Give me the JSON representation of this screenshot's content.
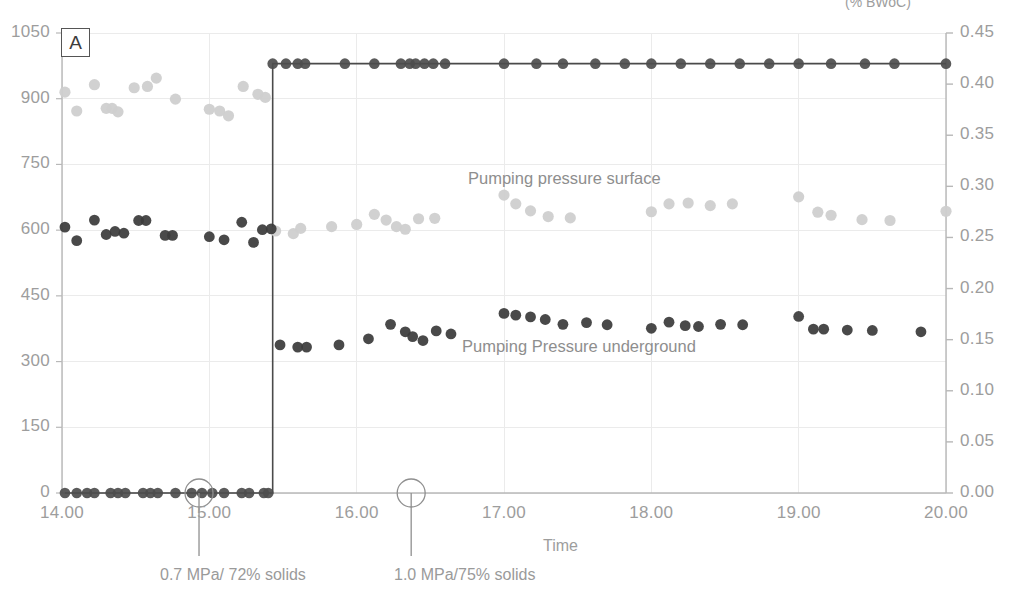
{
  "figure": {
    "panel_letter": "A",
    "background": "#ffffff"
  },
  "axes": {
    "x": {
      "label": "Time",
      "ticks": [
        "14.00",
        "15.00",
        "16.00",
        "17.00",
        "18.00",
        "19.00",
        "20.00"
      ],
      "min": 14.0,
      "max": 20.0
    },
    "y_left": {
      "ticks": [
        "0",
        "150",
        "300",
        "450",
        "600",
        "750",
        "900",
        "1050"
      ],
      "min": 0,
      "max": 1050,
      "label": ""
    },
    "y_right": {
      "ticks": [
        "0.00",
        "0.05",
        "0.10",
        "0.15",
        "0.20",
        "0.25",
        "0.30",
        "0.35",
        "0.40",
        "0.45"
      ],
      "min": 0.0,
      "max": 0.45,
      "label": "(% BWoC)"
    }
  },
  "series_labels": {
    "surface": "Pumping pressure surface",
    "underground": "Pumping Pressure underground"
  },
  "annotations": [
    {
      "text": "0.7 MPa/ 72% solids",
      "x": 14.93
    },
    {
      "text": "1.0 MPa/75% solids",
      "x": 16.37
    }
  ],
  "colors": {
    "surface_marker": "#cfcfcf",
    "underground_marker": "#3b3b3b",
    "step_line": "#4a4a4a",
    "grid": "#ebebeb",
    "axis": "#b8b8b8",
    "tick_text": "#9d9d9d"
  },
  "chart_data": {
    "type": "scatter",
    "title": "",
    "xlabel": "Time",
    "ylabel": "",
    "y2label": "(% BWoC)",
    "xlim": [
      14.0,
      20.0
    ],
    "ylim": [
      0,
      1050
    ],
    "y2lim": [
      0.0,
      0.45
    ],
    "grid": true,
    "legend": "inline-text-labels",
    "series": [
      {
        "name": "Pumping pressure surface",
        "axis": "left",
        "marker": "circle",
        "color": "#cfcfcf",
        "points": [
          [
            14.02,
            915
          ],
          [
            14.1,
            872
          ],
          [
            14.22,
            932
          ],
          [
            14.3,
            878
          ],
          [
            14.34,
            878
          ],
          [
            14.38,
            870
          ],
          [
            14.49,
            925
          ],
          [
            14.58,
            928
          ],
          [
            14.64,
            947
          ],
          [
            14.77,
            899
          ],
          [
            15.0,
            876
          ],
          [
            15.07,
            872
          ],
          [
            15.13,
            861
          ],
          [
            15.23,
            928
          ],
          [
            15.33,
            910
          ],
          [
            15.38,
            903
          ],
          [
            15.45,
            598
          ],
          [
            15.57,
            592
          ],
          [
            15.62,
            604
          ],
          [
            15.83,
            608
          ],
          [
            16.0,
            613
          ],
          [
            16.12,
            636
          ],
          [
            16.2,
            623
          ],
          [
            16.27,
            608
          ],
          [
            16.33,
            602
          ],
          [
            16.42,
            626
          ],
          [
            16.53,
            627
          ],
          [
            17.0,
            680
          ],
          [
            17.08,
            660
          ],
          [
            17.18,
            644
          ],
          [
            17.3,
            631
          ],
          [
            17.45,
            628
          ],
          [
            18.0,
            642
          ],
          [
            18.12,
            660
          ],
          [
            18.25,
            662
          ],
          [
            18.4,
            656
          ],
          [
            18.55,
            660
          ],
          [
            19.0,
            676
          ],
          [
            19.13,
            641
          ],
          [
            19.22,
            634
          ],
          [
            19.43,
            624
          ],
          [
            19.62,
            622
          ],
          [
            20.0,
            643
          ]
        ]
      },
      {
        "name": "Pumping Pressure underground",
        "axis": "left",
        "marker": "circle",
        "color": "#3b3b3b",
        "points": [
          [
            14.02,
            607
          ],
          [
            14.1,
            576
          ],
          [
            14.22,
            623
          ],
          [
            14.3,
            590
          ],
          [
            14.36,
            597
          ],
          [
            14.42,
            593
          ],
          [
            14.52,
            622
          ],
          [
            14.57,
            622
          ],
          [
            14.7,
            588
          ],
          [
            14.75,
            588
          ],
          [
            15.0,
            585
          ],
          [
            15.1,
            578
          ],
          [
            15.22,
            618
          ],
          [
            15.3,
            572
          ],
          [
            15.36,
            601
          ],
          [
            15.42,
            603
          ],
          [
            15.48,
            338
          ],
          [
            15.6,
            333
          ],
          [
            15.66,
            333
          ],
          [
            15.88,
            338
          ],
          [
            16.08,
            352
          ],
          [
            16.23,
            385
          ],
          [
            16.33,
            368
          ],
          [
            16.38,
            357
          ],
          [
            16.45,
            348
          ],
          [
            16.54,
            370
          ],
          [
            16.64,
            363
          ],
          [
            17.0,
            410
          ],
          [
            17.08,
            406
          ],
          [
            17.18,
            402
          ],
          [
            17.28,
            396
          ],
          [
            17.4,
            385
          ],
          [
            17.56,
            389
          ],
          [
            17.7,
            384
          ],
          [
            18.0,
            376
          ],
          [
            18.12,
            390
          ],
          [
            18.23,
            382
          ],
          [
            18.32,
            380
          ],
          [
            18.47,
            385
          ],
          [
            18.62,
            384
          ],
          [
            19.0,
            403
          ],
          [
            19.1,
            374
          ],
          [
            19.17,
            374
          ],
          [
            19.33,
            372
          ],
          [
            19.5,
            371
          ],
          [
            19.83,
            368
          ]
        ]
      },
      {
        "name": "Step trace (% BWoC)",
        "axis": "right",
        "marker": "circle-line",
        "color": "#3b3b3b",
        "points": [
          [
            14.02,
            0.0
          ],
          [
            14.1,
            0.0
          ],
          [
            14.17,
            0.0
          ],
          [
            14.22,
            0.0
          ],
          [
            14.33,
            0.0
          ],
          [
            14.38,
            0.0
          ],
          [
            14.43,
            0.0
          ],
          [
            14.55,
            0.0
          ],
          [
            14.6,
            0.0
          ],
          [
            14.65,
            0.0
          ],
          [
            14.77,
            0.0
          ],
          [
            14.88,
            0.0
          ],
          [
            14.95,
            0.0
          ],
          [
            15.02,
            0.0
          ],
          [
            15.1,
            0.0
          ],
          [
            15.22,
            0.0
          ],
          [
            15.27,
            0.0
          ],
          [
            15.37,
            0.0
          ],
          [
            15.4,
            0.0
          ],
          [
            15.43,
            0.42
          ],
          [
            15.52,
            0.42
          ],
          [
            15.6,
            0.42
          ],
          [
            15.65,
            0.42
          ],
          [
            15.92,
            0.42
          ],
          [
            16.12,
            0.42
          ],
          [
            16.3,
            0.42
          ],
          [
            16.36,
            0.42
          ],
          [
            16.4,
            0.42
          ],
          [
            16.46,
            0.42
          ],
          [
            16.52,
            0.42
          ],
          [
            16.6,
            0.42
          ],
          [
            17.0,
            0.42
          ],
          [
            17.22,
            0.42
          ],
          [
            17.4,
            0.42
          ],
          [
            17.62,
            0.42
          ],
          [
            17.82,
            0.42
          ],
          [
            18.0,
            0.42
          ],
          [
            18.2,
            0.42
          ],
          [
            18.4,
            0.42
          ],
          [
            18.6,
            0.42
          ],
          [
            18.8,
            0.42
          ],
          [
            19.0,
            0.42
          ],
          [
            19.22,
            0.42
          ],
          [
            19.45,
            0.42
          ],
          [
            19.65,
            0.42
          ],
          [
            20.0,
            0.42
          ]
        ]
      }
    ],
    "annotations": [
      {
        "label": "0.7 MPa/ 72% solids",
        "x": 14.93,
        "y": 0,
        "marker": "circle-callout"
      },
      {
        "label": "1.0 MPa/75% solids",
        "x": 16.37,
        "y": 0,
        "marker": "circle-callout"
      }
    ]
  }
}
